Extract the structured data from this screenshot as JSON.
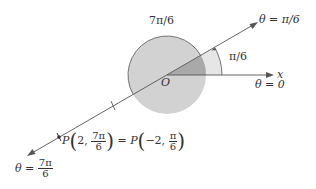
{
  "diagram": {
    "labels": {
      "arc_top": "7π/6",
      "ray_upper": "θ = π/6",
      "angle_small": "π/6",
      "x_axis": "x",
      "theta_zero": "θ = 0",
      "origin": "O",
      "theta_lower_lhs": "θ = ",
      "theta_lower_num": "7π",
      "theta_lower_den": "6",
      "point_P1": "P",
      "point_arg1_a": "2, ",
      "point_arg1_num": "7π",
      "point_arg1_den": "6",
      "equals": " = ",
      "point_P2": "P",
      "point_arg2_a": "−2, ",
      "point_arg2_num": "π",
      "point_arg2_den": "6"
    },
    "colors": {
      "circle_fill": "#d2d2d2",
      "wedge_light": "#e6e6e6",
      "wedge_dark": "#a9a9a9",
      "line": "#555555"
    }
  }
}
